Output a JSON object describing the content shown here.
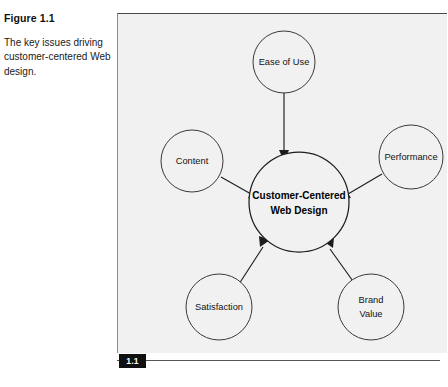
{
  "figure": {
    "label": "Figure 1.1",
    "caption": "The key issues driving customer-centered Web design.",
    "badge": "1.1"
  },
  "colors": {
    "panel_background": "#f1f1f1",
    "stroke": "#1d1d1d",
    "badge_background": "#101010",
    "badge_text": "#ffffff",
    "page_background": "#ffffff"
  },
  "diagram": {
    "type": "hub-and-spoke",
    "center": {
      "id": "center",
      "line1": "Customer-Centered",
      "line2": "Web Design"
    },
    "nodes": [
      {
        "id": "ease-of-use",
        "label": "Ease of Use",
        "line1": "Ease of Use",
        "line2": ""
      },
      {
        "id": "content",
        "label": "Content",
        "line1": "Content",
        "line2": ""
      },
      {
        "id": "performance",
        "label": "Performance",
        "line1": "Performance",
        "line2": ""
      },
      {
        "id": "satisfaction",
        "label": "Satisfaction",
        "line1": "Satisfaction",
        "line2": ""
      },
      {
        "id": "brand-value",
        "label": "Brand Value",
        "line1": "Brand",
        "line2": "Value"
      }
    ],
    "arrow_direction": "inward-to-center"
  }
}
